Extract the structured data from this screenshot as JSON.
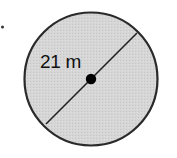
{
  "diagram": {
    "type": "circle-with-diameter",
    "shape": "circle",
    "measurement": {
      "label": "21 m",
      "value": 21,
      "unit": "m",
      "refers_to": "diameter"
    },
    "colors": {
      "fill": "#d4d4d4",
      "stroke": "#2a2a2a",
      "center_dot": "#000000",
      "background": "#ffffff"
    }
  }
}
